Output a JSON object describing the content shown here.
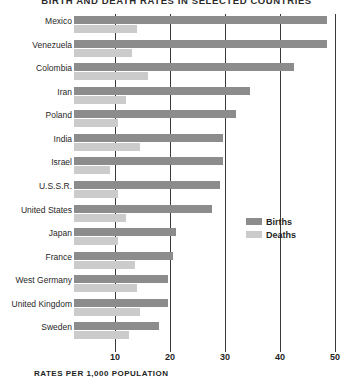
{
  "chart_data": {
    "type": "bar",
    "orientation": "horizontal",
    "title": "BIRTH AND DEATH RATES IN SELECTED COUNTRIES",
    "xlabel": "RATES PER 1,000 POPULATION",
    "ylabel": "",
    "xlim": [
      0,
      50
    ],
    "xticks": [
      10,
      20,
      30,
      40,
      50
    ],
    "xtick_labels": [
      "10",
      "20",
      "30",
      "40",
      "50"
    ],
    "grid": true,
    "grid_axis": "x",
    "legend_position": "middle-right",
    "categories": [
      "Mexico",
      "Venezuela",
      "Colombia",
      "Iran",
      "Poland",
      "India",
      "Israel",
      "U.S.S.R.",
      "United States",
      "Japan",
      "France",
      "West Germany",
      "United Kingdom",
      "Sweden"
    ],
    "series": [
      {
        "name": "Births",
        "color": "#8c8c8c",
        "values": [
          46,
          46,
          40,
          32,
          29.5,
          27,
          27,
          26.5,
          25,
          18.5,
          18,
          17,
          17,
          15.5
        ]
      },
      {
        "name": "Deaths",
        "color": "#cbcbcb",
        "values": [
          11.5,
          10.5,
          13.5,
          9.5,
          8,
          12,
          6.5,
          8,
          9.5,
          8,
          11,
          11.5,
          12,
          10
        ]
      }
    ]
  },
  "legend": {
    "items": [
      {
        "label": "Births",
        "swatch": "births"
      },
      {
        "label": "Deaths",
        "swatch": "deaths"
      }
    ]
  }
}
